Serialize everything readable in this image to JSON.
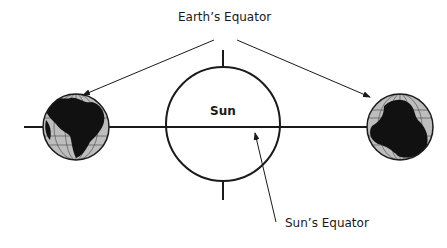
{
  "diagram": {
    "labels": {
      "earth_equator": "Earth’s Equator",
      "sun": "Sun",
      "sun_equator": "Sun’s Equator"
    },
    "colors": {
      "stroke": "#1a1a1a",
      "land": "#111111",
      "ocean": "#bdbdbd",
      "grid": "#555555",
      "background": "#ffffff"
    },
    "elements": [
      {
        "id": "sun",
        "type": "circle",
        "label": "Sun"
      },
      {
        "id": "earth-left",
        "type": "globe"
      },
      {
        "id": "earth-right",
        "type": "globe"
      },
      {
        "id": "ecliptic-line",
        "type": "line"
      },
      {
        "id": "sun-axis-ticks",
        "type": "line"
      }
    ],
    "edges": [
      {
        "from": "earth_equator_label",
        "to": "earth-left",
        "type": "arrow"
      },
      {
        "from": "earth_equator_label",
        "to": "earth-right",
        "type": "arrow"
      },
      {
        "from": "sun_equator_label",
        "to": "sun-equator",
        "type": "arrow"
      }
    ]
  }
}
